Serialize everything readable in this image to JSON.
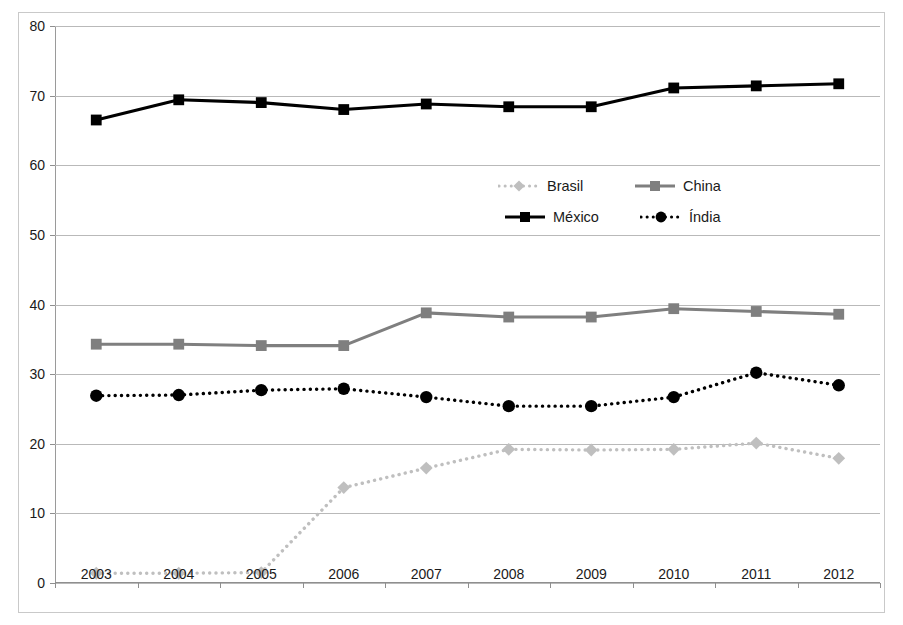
{
  "chart_data": {
    "type": "line",
    "title": "",
    "xlabel": "",
    "ylabel": "",
    "categories": [
      "2003",
      "2004",
      "2005",
      "2006",
      "2007",
      "2008",
      "2009",
      "2010",
      "2011",
      "2012"
    ],
    "x_tick_labels": [
      "2003",
      "2004",
      "2005",
      "2006",
      "2007",
      "2008",
      "2009",
      "2010",
      "2011",
      "2012"
    ],
    "y_tick_labels": [
      "0",
      "10",
      "20",
      "30",
      "40",
      "50",
      "60",
      "70",
      "80"
    ],
    "y_ticks": [
      0,
      10,
      20,
      30,
      40,
      50,
      60,
      70,
      80
    ],
    "ylim": [
      0,
      80
    ],
    "grid": true,
    "legend_position": "inside-center",
    "series": [
      {
        "name": "Brasil",
        "color": "#bfbfbf",
        "marker": "diamond",
        "line_style": "dotted",
        "values": [
          1.4,
          1.4,
          1.5,
          13.7,
          16.5,
          19.2,
          19.1,
          19.2,
          20.1,
          17.9
        ]
      },
      {
        "name": "China",
        "color": "#7f7f7f",
        "marker": "square",
        "line_style": "solid",
        "values": [
          34.3,
          34.3,
          34.1,
          34.1,
          38.8,
          38.2,
          38.2,
          39.4,
          39.0,
          38.6
        ]
      },
      {
        "name": "México",
        "color": "#000000",
        "marker": "square",
        "line_style": "solid",
        "values": [
          66.5,
          69.4,
          69.0,
          68.0,
          68.8,
          68.4,
          68.4,
          71.1,
          71.4,
          71.7
        ]
      },
      {
        "name": "Índia",
        "color": "#000000",
        "marker": "circle",
        "line_style": "dotted",
        "values": [
          26.9,
          27.0,
          27.7,
          27.9,
          26.7,
          25.4,
          25.4,
          26.7,
          30.2,
          28.4
        ]
      }
    ]
  },
  "legend": {
    "items": [
      {
        "label": "Brasil",
        "color": "#bfbfbf",
        "marker": "diamond",
        "line_style": "dotted"
      },
      {
        "label": "China",
        "color": "#7f7f7f",
        "marker": "square",
        "line_style": "solid"
      },
      {
        "label": "México",
        "color": "#000000",
        "marker": "square",
        "line_style": "solid"
      },
      {
        "label": "Índia",
        "color": "#000000",
        "marker": "circle",
        "line_style": "dotted"
      }
    ]
  }
}
